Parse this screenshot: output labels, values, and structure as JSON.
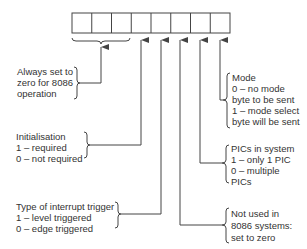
{
  "diagram": {
    "register": {
      "bit_count": 8
    },
    "annotations": {
      "always_zero": {
        "lines": [
          "Always set to",
          "zero for 8086",
          "operation"
        ]
      },
      "initialisation": {
        "lines": [
          "Initialisation",
          "1 – required",
          "0 – not required"
        ]
      },
      "trigger_type": {
        "lines": [
          "Type of interrupt trigger",
          "1 – level triggered",
          "0 – edge triggered"
        ]
      },
      "mode": {
        "lines": [
          "Mode",
          "0 – no mode",
          "byte to be sent",
          "1 – mode select",
          "byte will be sent"
        ]
      },
      "pics_in_system": {
        "lines": [
          "PICs in system",
          "1 – only 1 PIC",
          "0 – multiple",
          "PICs"
        ]
      },
      "not_used": {
        "lines": [
          "Not used in",
          "8086 systems:",
          "set to zero"
        ]
      }
    },
    "colors": {
      "line": "#444444",
      "text": "#333333",
      "background": "#ffffff"
    }
  }
}
